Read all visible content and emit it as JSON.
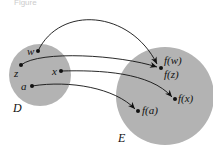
{
  "figure": {
    "caption_fragment": "Figure",
    "domain_set": {
      "label": "D",
      "fill": "#b3b3b3",
      "points": [
        {
          "id": "w",
          "label": "w",
          "x": 38,
          "y": 51
        },
        {
          "id": "z",
          "label": "z",
          "x": 21,
          "y": 65
        },
        {
          "id": "x",
          "label": "x",
          "x": 61,
          "y": 71
        },
        {
          "id": "a",
          "label": "a",
          "x": 32,
          "y": 86
        }
      ]
    },
    "codomain_set": {
      "label": "E",
      "fill": "#b3b3b3",
      "points": [
        {
          "id": "fw",
          "label": "f(w)"
        },
        {
          "id": "fz",
          "label": "f(z)"
        },
        {
          "id": "fx",
          "label": "f(x)"
        },
        {
          "id": "fa",
          "label": "f(a)"
        }
      ]
    },
    "mappings": [
      {
        "from": "w",
        "to": "f(w)"
      },
      {
        "from": "z",
        "to": "f(z)"
      },
      {
        "from": "x",
        "to": "f(x)"
      },
      {
        "from": "a",
        "to": "f(a)"
      }
    ]
  }
}
